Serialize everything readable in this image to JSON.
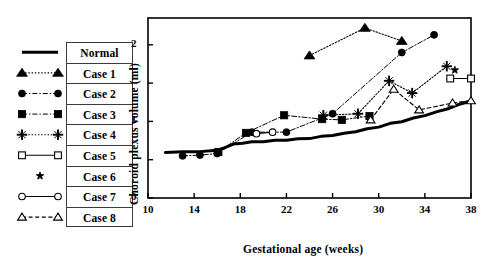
{
  "figure": {
    "background": "#ffffff",
    "frame_color": "#000000"
  },
  "legend": {
    "entries": [
      {
        "label": "Normal",
        "marker": "none",
        "line": "solid-thick",
        "icon_name": "legend-line-normal"
      },
      {
        "label": "Case 1",
        "marker": "triangle-up",
        "line": "dotted",
        "icon_name": "legend-marker-triangle-up"
      },
      {
        "label": "Case 2",
        "marker": "circle",
        "line": "dash-dot",
        "icon_name": "legend-marker-circle"
      },
      {
        "label": "Case 3",
        "marker": "square",
        "line": "dash-dot",
        "icon_name": "legend-marker-square"
      },
      {
        "label": "Case 4",
        "marker": "plus",
        "line": "dotted",
        "icon_name": "legend-marker-plus"
      },
      {
        "label": "Case 5",
        "marker": "open-square",
        "line": "solid",
        "icon_name": "legend-marker-open-square"
      },
      {
        "label": "Case 6",
        "marker": "star",
        "line": "none",
        "icon_name": "legend-marker-star"
      },
      {
        "label": "Case 7",
        "marker": "open-circle",
        "line": "solid",
        "icon_name": "legend-marker-open-circle"
      },
      {
        "label": "Case 8",
        "marker": "open-triangle",
        "line": "dashed",
        "icon_name": "legend-marker-open-triangle"
      }
    ]
  },
  "chart_data": {
    "type": "scatter",
    "title": "",
    "xlabel": "Gestational age (weeks)",
    "ylabel": "Choroid plexus volume (ml)",
    "xlim": [
      10,
      38
    ],
    "ylim": [
      0,
      2.35
    ],
    "xticks": [
      10,
      14,
      18,
      22,
      26,
      30,
      34,
      38
    ],
    "xtick_labels": [
      "10",
      "14",
      "18",
      "22",
      "26",
      "30",
      "34",
      "38"
    ],
    "yticks": [
      0,
      0.5,
      1,
      1.5,
      2
    ],
    "ytick_labels": [
      "0",
      "",
      "1",
      "",
      "2"
    ],
    "grid": false,
    "legend_position": "outside-left",
    "series": [
      {
        "name": "Normal",
        "marker": "none",
        "line": "solid-thick",
        "x": [
          11.5,
          13.0,
          14.5,
          16.0,
          16.6,
          17.4,
          18.2,
          19.0,
          20.0,
          21.0,
          22.0,
          23.0,
          24.0,
          25.0,
          26.0,
          27.0,
          28.0,
          29.0,
          30.0,
          31.0,
          32.0,
          33.0,
          34.0,
          35.0,
          36.0,
          37.0,
          38.0
        ],
        "y": [
          0.6,
          0.6,
          0.61,
          0.62,
          0.66,
          0.7,
          0.72,
          0.73,
          0.74,
          0.75,
          0.76,
          0.77,
          0.78,
          0.8,
          0.82,
          0.84,
          0.87,
          0.9,
          0.93,
          0.97,
          1.0,
          1.04,
          1.08,
          1.12,
          1.17,
          1.22,
          1.27
        ]
      },
      {
        "name": "Case 1",
        "marker": "triangle-up",
        "line": "dotted",
        "x": [
          24.0,
          28.8,
          32.0
        ],
        "y": [
          1.86,
          2.22,
          2.05
        ]
      },
      {
        "name": "Case 2",
        "marker": "circle",
        "line": "dash-dot",
        "x": [
          13.0,
          14.5,
          16.0,
          19.0,
          22.0,
          26.0,
          32.0,
          34.8
        ],
        "y": [
          0.55,
          0.56,
          0.58,
          0.86,
          0.86,
          1.1,
          1.9,
          2.13
        ]
      },
      {
        "name": "Case 3",
        "marker": "square",
        "line": "dash-dot",
        "x": [
          16.1,
          18.5,
          21.8,
          25.1,
          26.8,
          29.2
        ],
        "y": [
          0.6,
          0.85,
          1.08,
          1.03,
          1.02,
          1.07
        ]
      },
      {
        "name": "Case 4",
        "marker": "plus",
        "line": "dotted",
        "x": [
          25.2,
          28.2,
          30.9,
          32.9,
          35.9
        ],
        "y": [
          1.08,
          1.1,
          1.53,
          1.37,
          1.72
        ]
      },
      {
        "name": "Case 5",
        "marker": "open-square",
        "line": "solid",
        "x": [
          36.2,
          38.0
        ],
        "y": [
          1.56,
          1.56
        ]
      },
      {
        "name": "Case 6",
        "marker": "star",
        "line": "none",
        "x": [
          36.6
        ],
        "y": [
          1.67
        ]
      },
      {
        "name": "Case 7",
        "marker": "open-circle",
        "line": "solid",
        "x": [
          19.4,
          20.8
        ],
        "y": [
          0.84,
          0.86
        ]
      },
      {
        "name": "Case 8",
        "marker": "open-triangle",
        "line": "dashed",
        "x": [
          29.3,
          31.3,
          33.5,
          36.4,
          38.0
        ],
        "y": [
          1.02,
          1.42,
          1.15,
          1.24,
          1.27
        ]
      }
    ]
  }
}
